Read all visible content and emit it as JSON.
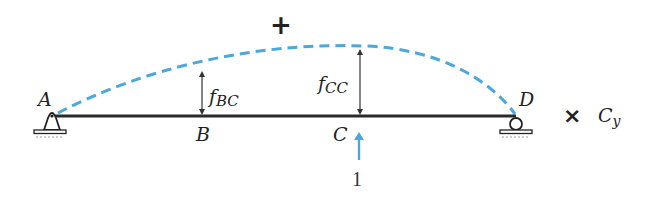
{
  "diagram": {
    "type": "beam-deflection-influence",
    "sign_label": "+",
    "points": {
      "A": "A",
      "B": "B",
      "C": "C",
      "D": "D"
    },
    "deflections": {
      "f_BC": {
        "main": "f",
        "sub": "BC"
      },
      "f_CC": {
        "main": "f",
        "sub": "CC"
      }
    },
    "unit_load": "1",
    "multiplier": {
      "symbol": "×",
      "redundant_main": "C",
      "redundant_sub": "y"
    },
    "colors": {
      "beam": "#2a2a2a",
      "deflected_shape": "#4aa8dc",
      "unit_load_arrow": "#4aa8dc",
      "dimension_arrows": "#333333",
      "text": "#222222"
    },
    "supports": {
      "A": "pin",
      "D": "roller"
    }
  }
}
